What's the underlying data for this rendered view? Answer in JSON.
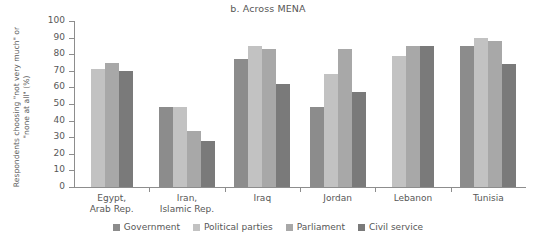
{
  "chart_data": {
    "type": "bar",
    "title": "b. Across MENA",
    "xlabel": "",
    "ylabel": "Respondents choosing \"not very much\" or \"none at all\" (%)",
    "ylim": [
      0,
      100
    ],
    "yticks": [
      0,
      10,
      20,
      30,
      40,
      50,
      60,
      70,
      80,
      90,
      100
    ],
    "grid": false,
    "legend_position": "bottom",
    "categories": [
      "Egypt, Arab Rep.",
      "Iran, Islamic Rep.",
      "Iraq",
      "Jordan",
      "Lebanon",
      "Tunisia"
    ],
    "category_lines": [
      [
        "Egypt,",
        "Arab Rep."
      ],
      [
        "Iran,",
        "Islamic Rep."
      ],
      [
        "Iraq"
      ],
      [
        "Jordan"
      ],
      [
        "Lebanon"
      ],
      [
        "Tunisia"
      ]
    ],
    "series": [
      {
        "name": "Government",
        "color": "#8c8c8c",
        "values": [
          null,
          48,
          77,
          48,
          null,
          85
        ]
      },
      {
        "name": "Political parties",
        "color": "#c2c2c2",
        "values": [
          71,
          48,
          85,
          68,
          79,
          90
        ]
      },
      {
        "name": "Parliament",
        "color": "#a8a8a8",
        "values": [
          75,
          34,
          83,
          83,
          85,
          88
        ]
      },
      {
        "name": "Civil service",
        "color": "#7a7a7a",
        "values": [
          70,
          28,
          62,
          57,
          85,
          74
        ]
      }
    ]
  }
}
